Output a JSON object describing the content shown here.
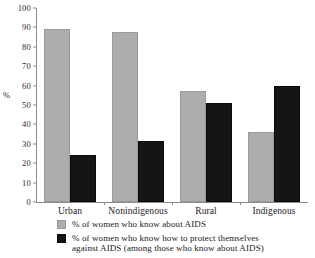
{
  "chart_data": {
    "type": "bar",
    "title": "",
    "subtitle": "",
    "xlabel": "",
    "ylabel": "%",
    "ylim": [
      0,
      100
    ],
    "yticks": [
      0,
      10,
      20,
      30,
      40,
      50,
      60,
      70,
      80,
      90,
      100
    ],
    "grid": false,
    "legend_position": "bottom-left",
    "categories": [
      "Urban",
      "Nonindigenous",
      "Rural",
      "Indigenous"
    ],
    "series": [
      {
        "name": "% of women who know about AIDS",
        "color": "#adadad",
        "values": [
          89,
          87.5,
          57,
          36
        ]
      },
      {
        "name": "% of women who know how to protect themselves against AIDS (among those who know about AIDS)",
        "color": "#151515",
        "values": [
          24,
          31.5,
          51,
          60
        ]
      }
    ]
  },
  "legend": {
    "entries": [
      {
        "swatch": "light",
        "line1": "% of women who know about AIDS",
        "line2": ""
      },
      {
        "swatch": "dark",
        "line1": "% of women who know how to protect themselves",
        "line2": "against AIDS (among those who know about AIDS)"
      }
    ]
  }
}
